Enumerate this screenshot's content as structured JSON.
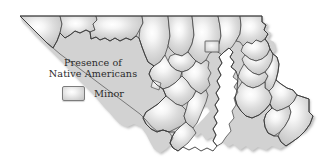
{
  "figure": {
    "name": "maryland-native-american-presence-map",
    "region": "Maryland",
    "background_color": "#ffffff",
    "outline_color": "#3a3a3a",
    "fill_light": "#ffffff",
    "fill_dark": "#c2c2c2",
    "water_color": "#ffffff"
  },
  "legend": {
    "title_line1": "Presence of",
    "title_line2": "Native Americans",
    "entries": [
      {
        "label": "Minor",
        "swatch_name": "legend-swatch-minor",
        "swatch_fill_center": "#ffffff",
        "swatch_fill_edge": "#c2c2c2",
        "swatch_border": "#7c7c7c"
      }
    ]
  },
  "map": {
    "state_outline_name": "maryland-state-outline",
    "counties": [
      {
        "id": "garrett",
        "name": "Garrett"
      },
      {
        "id": "allegany",
        "name": "Allegany"
      },
      {
        "id": "washington",
        "name": "Washington"
      },
      {
        "id": "frederick",
        "name": "Frederick"
      },
      {
        "id": "carroll",
        "name": "Carroll"
      },
      {
        "id": "baltimore-county",
        "name": "Baltimore County"
      },
      {
        "id": "harford",
        "name": "Harford"
      },
      {
        "id": "cecil",
        "name": "Cecil"
      },
      {
        "id": "baltimore-city",
        "name": "Baltimore City"
      },
      {
        "id": "howard",
        "name": "Howard"
      },
      {
        "id": "montgomery",
        "name": "Montgomery"
      },
      {
        "id": "prince-georges",
        "name": "Prince George's"
      },
      {
        "id": "anne-arundel",
        "name": "Anne Arundel"
      },
      {
        "id": "charles",
        "name": "Charles"
      },
      {
        "id": "calvert",
        "name": "Calvert"
      },
      {
        "id": "st-marys",
        "name": "St. Mary's"
      },
      {
        "id": "kent",
        "name": "Kent"
      },
      {
        "id": "queen-annes",
        "name": "Queen Anne's"
      },
      {
        "id": "talbot",
        "name": "Talbot"
      },
      {
        "id": "caroline",
        "name": "Caroline"
      },
      {
        "id": "dorchester",
        "name": "Dorchester"
      },
      {
        "id": "wicomico",
        "name": "Wicomico"
      },
      {
        "id": "somerset",
        "name": "Somerset"
      },
      {
        "id": "worcester",
        "name": "Worcester"
      }
    ]
  }
}
